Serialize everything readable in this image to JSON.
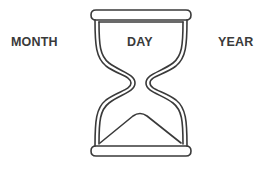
{
  "diagram": {
    "labels": {
      "left": "MONTH",
      "center": "DAY",
      "right": "YEAR"
    },
    "icon": "hourglass-icon",
    "colors": {
      "stroke": "#3a3a3a",
      "background": "#ffffff",
      "text": "#3a3a3a"
    }
  }
}
